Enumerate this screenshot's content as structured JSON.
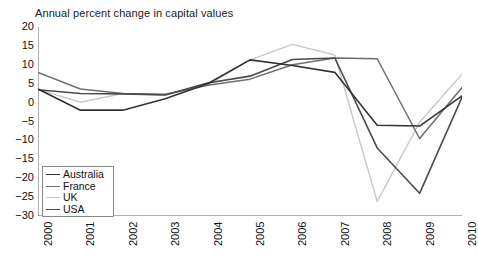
{
  "chart_data": {
    "type": "line",
    "title": "Annual percent change in capital values",
    "xlabel": "",
    "ylabel": "",
    "x": [
      2000,
      2001,
      2002,
      2003,
      2004,
      2005,
      2006,
      2007,
      2008,
      2009,
      2010
    ],
    "categories": [
      "2000",
      "2001",
      "2002",
      "2003",
      "2004",
      "2005",
      "2006",
      "2007",
      "2008",
      "2009",
      "2010"
    ],
    "xlim": [
      2000,
      2010
    ],
    "ylim": [
      -30,
      20
    ],
    "yticks": [
      20,
      15,
      10,
      5,
      0,
      -5,
      -10,
      -15,
      -20,
      -25,
      -30
    ],
    "ytick_labels": [
      "20",
      "15",
      "10",
      "5",
      "0",
      "-5",
      "-10",
      "-15",
      "-20",
      "-25",
      "-30"
    ],
    "grid": false,
    "legend_position": "lower left",
    "series": [
      {
        "name": "Australia",
        "color": "#333333",
        "width": 1.6,
        "values": [
          3.6,
          -2.0,
          -2.0,
          1.0,
          5.0,
          11.3,
          9.8,
          8.0,
          -6.0,
          -6.2,
          1.8
        ]
      },
      {
        "name": "France",
        "color": "#6e6e6e",
        "width": 1.5,
        "values": [
          8.0,
          3.6,
          2.4,
          2.2,
          4.6,
          6.2,
          10.0,
          11.8,
          11.6,
          -9.5,
          4.0
        ]
      },
      {
        "name": "UK",
        "color": "#c9c9c9",
        "width": 1.4,
        "values": [
          3.5,
          0.1,
          2.4,
          2.0,
          4.6,
          11.3,
          15.4,
          12.6,
          -26.2,
          -5.2,
          7.5
        ]
      },
      {
        "name": "USA",
        "color": "#4a4a4a",
        "width": 1.6,
        "values": [
          3.4,
          2.4,
          2.3,
          2.0,
          5.2,
          7.0,
          11.4,
          11.8,
          -12.0,
          -24.0,
          1.4
        ]
      }
    ]
  },
  "axes": {
    "title": "Annual percent change in capital values"
  }
}
